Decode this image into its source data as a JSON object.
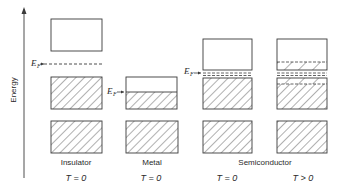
{
  "axis": {
    "label": "Energy"
  },
  "fermi_label": {
    "main": "E",
    "sub": "F"
  },
  "columns": [
    {
      "name": "Insulator",
      "temp": "T = 0",
      "temp_t": "T",
      "temp_rest": " = 0"
    },
    {
      "name": "Metal",
      "temp": "T = 0",
      "temp_t": "T",
      "temp_rest": " = 0"
    },
    {
      "name": "Semiconductor",
      "temp": "T = 0",
      "temp_t": "T",
      "temp_rest": " = 0"
    },
    {
      "name": "Semiconductor",
      "temp": "T > 0",
      "temp_t": "T",
      "temp_rest": " > 0"
    }
  ],
  "group_labels": {
    "insulator": "Insulator",
    "metal": "Metal",
    "semiconductor": "Semiconductor"
  },
  "temps": {
    "t0_a": "T = 0",
    "t0_b": "T = 0",
    "t0_c": "T = 0",
    "tgt0": "T > 0"
  },
  "colors": {
    "line": "#3a3a3a",
    "background": "#ffffff"
  }
}
